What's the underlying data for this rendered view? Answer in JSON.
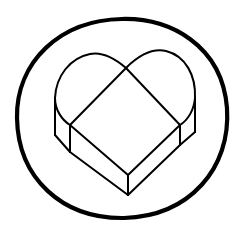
{
  "illustration": {
    "subject": "heart-shaped box inside a circle",
    "background_color": "#ffffff",
    "line_color": "#000000",
    "outer_ring": {
      "cx": 122,
      "cy": 118,
      "rx": 105,
      "ry": 100
    },
    "heart_box": {
      "top_notch": [
        126,
        68
      ],
      "left_outer_edge": [
        [
          55,
          100
        ],
        [
          55,
          135
        ]
      ],
      "left_inner_corner": [
        [
          70,
          125
        ],
        [
          70,
          152
        ]
      ],
      "front_corner": [
        [
          128,
          175
        ],
        [
          128,
          195
        ]
      ],
      "right_inner_corner": [
        [
          180,
          125
        ],
        [
          180,
          140
        ]
      ],
      "right_outer_edge": [
        [
          195,
          100
        ],
        [
          195,
          132
        ]
      ]
    }
  }
}
